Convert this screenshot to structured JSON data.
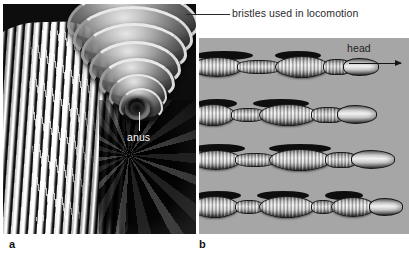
{
  "figure": {
    "type": "biology-figure",
    "background_color": "#ffffff",
    "width": 409,
    "height": 259
  },
  "panels": [
    {
      "id": "a",
      "caption": "a",
      "kind": "scanning-electron-micrograph",
      "description": "SEM of the posterior end of an earthworm showing segmented body rings, projecting bristles and the anus",
      "background_color": "#0a0a0a",
      "labels": [
        {
          "name": "bristles-label",
          "text": "bristles used in locomotion",
          "color": "#2a2a2a",
          "leader": "horizontal"
        },
        {
          "name": "anus-label",
          "text": "anus",
          "color": "#ffffff",
          "leader": "vertical"
        }
      ]
    },
    {
      "id": "b",
      "caption": "b",
      "kind": "illustration-sequence",
      "description": "Four successive stages of earthworm peristaltic locomotion; alternating contracted and extended segments propel the worm forward",
      "background_color": "#b6b6b6",
      "labels": [
        {
          "name": "head-label",
          "text": "head",
          "color": "#1e1e1e",
          "arrow": "right"
        }
      ],
      "stages": [
        {
          "index": 1,
          "head_x": 141
        },
        {
          "index": 2,
          "head_x": 163
        },
        {
          "index": 3,
          "head_x": 191
        },
        {
          "index": 4,
          "head_x": 204
        }
      ]
    }
  ]
}
